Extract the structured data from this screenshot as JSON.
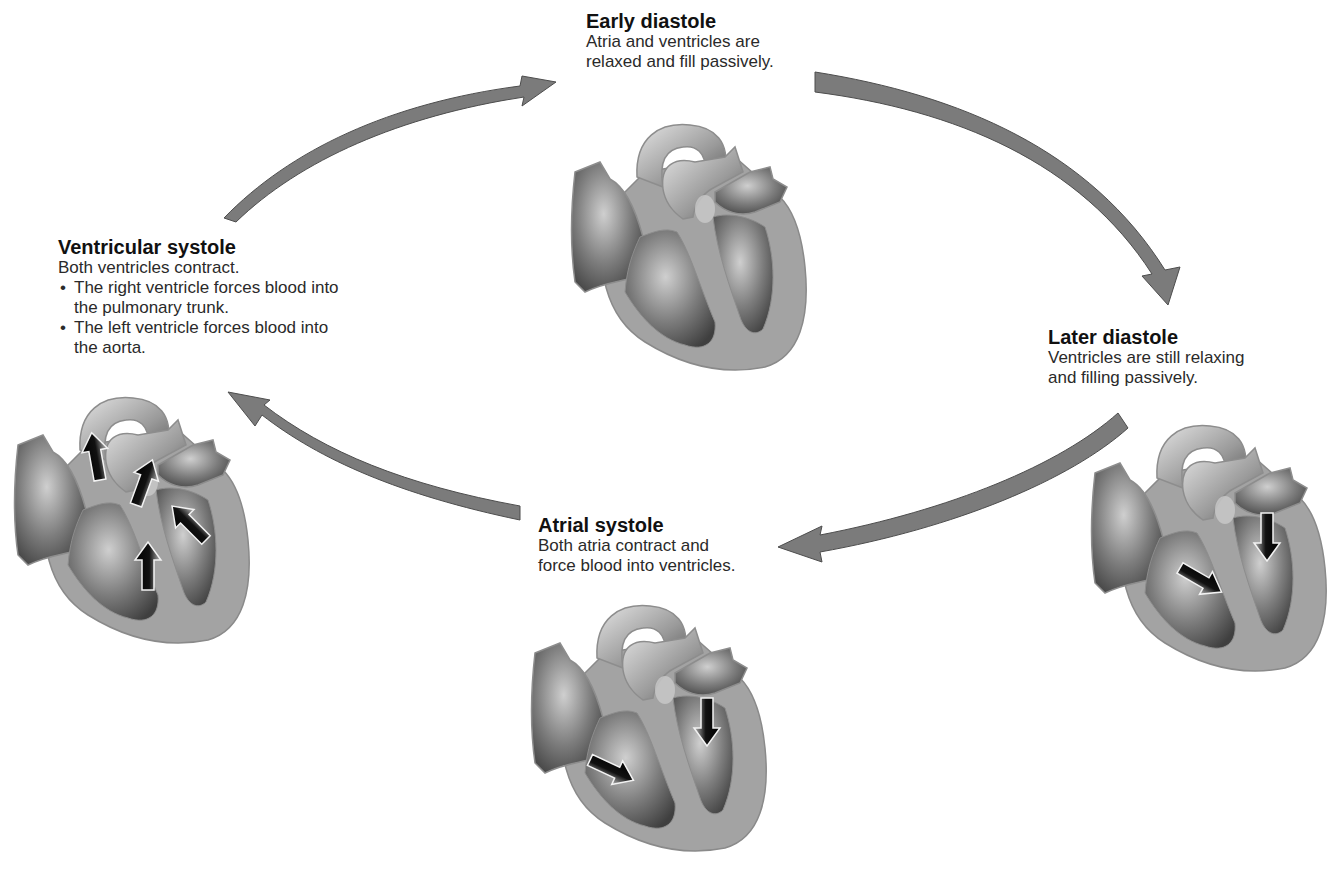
{
  "diagram": {
    "type": "cardiac-cycle",
    "colors": {
      "arrow_fill": "#7a7a7a",
      "arrow_stroke": "#4a4a4a",
      "heart_wall": "#9d9d9d",
      "heart_chamber": "#6f6f6f",
      "heart_highlight": "#d8d8d8",
      "flow_arrow": "#111111",
      "text": "#2a2a2a"
    },
    "stages": [
      {
        "id": "early-diastole",
        "title": "Early diastole",
        "description": "Atria and ventricles are\nrelaxed and fill passively.",
        "flow_arrows": 0
      },
      {
        "id": "later-diastole",
        "title": "Later diastole",
        "description": "Ventricles are still relaxing\nand filling passively.",
        "flow_arrows": 2
      },
      {
        "id": "atrial-systole",
        "title": "Atrial systole",
        "description": "Both atria contract and\nforce blood into ventricles.",
        "flow_arrows": 2
      },
      {
        "id": "ventricular-systole",
        "title": "Ventricular systole",
        "description": "Both ventricles contract.",
        "bullets": [
          "The right ventricle forces blood into the pulmonary trunk.",
          "The left ventricle forces blood into the aorta."
        ],
        "flow_arrows": 4
      }
    ],
    "cycle_arrows": [
      {
        "from": "ventricular-systole",
        "to": "early-diastole"
      },
      {
        "from": "early-diastole",
        "to": "later-diastole"
      },
      {
        "from": "later-diastole",
        "to": "atrial-systole"
      },
      {
        "from": "atrial-systole",
        "to": "ventricular-systole"
      }
    ]
  }
}
